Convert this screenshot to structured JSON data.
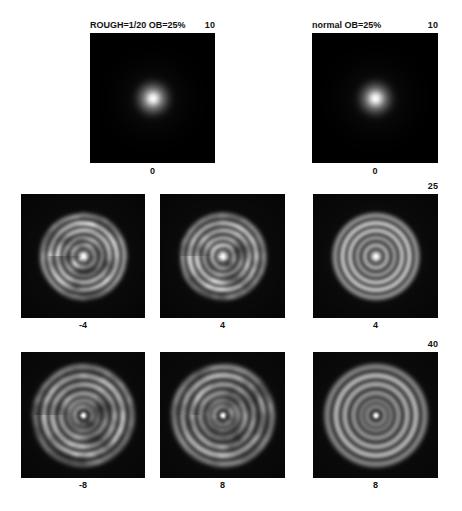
{
  "figure": {
    "kind": "point-spread-function defocus montage",
    "background_color": "#ffffff",
    "panel_background_color": "#000000",
    "text_color": "#111111"
  },
  "titles": {
    "left": "ROUGH=1/20  OB=25%",
    "right": "normal OB=25%"
  },
  "scale_labels": {
    "row1": "10",
    "row2": "25",
    "row3": "40"
  },
  "panels": [
    {
      "id": "r1c1",
      "row": 1,
      "column": 1,
      "caption": "0",
      "scale_max": "10",
      "condition": "ROUGH=1/20  OB=25%",
      "defocus": "0"
    },
    {
      "id": "r1c3",
      "row": 1,
      "column": 3,
      "caption": "0",
      "scale_max": "10",
      "condition": "normal OB=25%",
      "defocus": "0"
    },
    {
      "id": "r2c1",
      "row": 2,
      "column": 1,
      "caption": "-4",
      "scale_max": "25",
      "condition": "ROUGH=1/20  OB=25%",
      "defocus": "-4"
    },
    {
      "id": "r2c2",
      "row": 2,
      "column": 2,
      "caption": "4",
      "scale_max": "25",
      "condition": "ROUGH=1/20  OB=25%",
      "defocus": "4"
    },
    {
      "id": "r2c3",
      "row": 2,
      "column": 3,
      "caption": "4",
      "scale_max": "25",
      "condition": "normal OB=25%",
      "defocus": "4"
    },
    {
      "id": "r3c1",
      "row": 3,
      "column": 1,
      "caption": "-8",
      "scale_max": "40",
      "condition": "ROUGH=1/20  OB=25%",
      "defocus": "-8"
    },
    {
      "id": "r3c2",
      "row": 3,
      "column": 2,
      "caption": "8",
      "scale_max": "40",
      "condition": "ROUGH=1/20  OB=25%",
      "defocus": "8"
    },
    {
      "id": "r3c3",
      "row": 3,
      "column": 3,
      "caption": "8",
      "scale_max": "40",
      "condition": "normal OB=25%",
      "defocus": "8"
    }
  ],
  "chart_data": {
    "type": "heatmap",
    "colormap": "grayscale",
    "legend_position": "none",
    "grid": false,
    "xlabel": "",
    "ylabel": "",
    "rows": [
      {
        "scale_max": 10,
        "defocus_values": [
          0,
          null,
          0
        ],
        "panel_ids": [
          "r1c1",
          null,
          "r1c3"
        ]
      },
      {
        "scale_max": 25,
        "defocus_values": [
          -4,
          4,
          4
        ],
        "panel_ids": [
          "r2c1",
          "r2c2",
          "r2c3"
        ]
      },
      {
        "scale_max": 40,
        "defocus_values": [
          -8,
          8,
          8
        ],
        "panel_ids": [
          "r3c1",
          "r3c2",
          "r3c3"
        ]
      }
    ],
    "columns": [
      {
        "index": 1,
        "condition": "ROUGH=1/20  OB=25%",
        "surface": "rough"
      },
      {
        "index": 2,
        "condition": "ROUGH=1/20  OB=25%",
        "surface": "rough"
      },
      {
        "index": 3,
        "condition": "normal OB=25%",
        "surface": "normal"
      }
    ],
    "panel_intensity": [
      {
        "id": "r1c1",
        "defocus": 0,
        "scale_max": 10,
        "surface": "rough",
        "structure": "compact bright core with faint first ring",
        "core_radius_frac": 0.055,
        "ring_radii_frac": [
          0.1
        ],
        "ring_amplitudes": [
          0.18
        ],
        "envelope_radius_frac": 0.13,
        "speckle_amplitude": 0.05
      },
      {
        "id": "r1c3",
        "defocus": 0,
        "scale_max": 10,
        "surface": "normal",
        "structure": "compact bright core with faint first ring",
        "core_radius_frac": 0.055,
        "ring_radii_frac": [
          0.1
        ],
        "ring_amplitudes": [
          0.16
        ],
        "envelope_radius_frac": 0.13,
        "speckle_amplitude": 0.0
      },
      {
        "id": "r2c1",
        "defocus": -4,
        "scale_max": 25,
        "surface": "rough",
        "structure": "speckled concentric rings, azimuthally broken",
        "core_radius_frac": 0.035,
        "ring_radii_frac": [
          0.09,
          0.15,
          0.21,
          0.27,
          0.33
        ],
        "ring_amplitudes": [
          0.55,
          0.45,
          0.7,
          0.85,
          0.6
        ],
        "envelope_radius_frac": 0.38,
        "speckle_amplitude": 0.55
      },
      {
        "id": "r2c2",
        "defocus": 4,
        "scale_max": 25,
        "surface": "rough",
        "structure": "speckled concentric rings, azimuthally broken",
        "core_radius_frac": 0.035,
        "ring_radii_frac": [
          0.09,
          0.15,
          0.21,
          0.27,
          0.33
        ],
        "ring_amplitudes": [
          0.55,
          0.45,
          0.7,
          0.85,
          0.6
        ],
        "envelope_radius_frac": 0.38,
        "speckle_amplitude": 0.55
      },
      {
        "id": "r2c3",
        "defocus": 4,
        "scale_max": 25,
        "surface": "normal",
        "structure": "smooth concentric rings",
        "core_radius_frac": 0.035,
        "ring_radii_frac": [
          0.09,
          0.15,
          0.21,
          0.27,
          0.33
        ],
        "ring_amplitudes": [
          0.6,
          0.5,
          0.78,
          0.92,
          0.66
        ],
        "envelope_radius_frac": 0.4,
        "speckle_amplitude": 0.0
      },
      {
        "id": "r3c1",
        "defocus": -8,
        "scale_max": 40,
        "surface": "rough",
        "structure": "speckled wide rings with dark obscured centre",
        "core_radius_frac": 0.02,
        "ring_radii_frac": [
          0.07,
          0.12,
          0.18,
          0.25,
          0.32,
          0.39
        ],
        "ring_amplitudes": [
          0.35,
          0.3,
          0.45,
          0.62,
          0.8,
          0.55
        ],
        "envelope_radius_frac": 0.44,
        "speckle_amplitude": 0.55
      },
      {
        "id": "r3c2",
        "defocus": 8,
        "scale_max": 40,
        "surface": "rough",
        "structure": "speckled wide rings with dark obscured centre",
        "core_radius_frac": 0.02,
        "ring_radii_frac": [
          0.07,
          0.12,
          0.18,
          0.25,
          0.32,
          0.39
        ],
        "ring_amplitudes": [
          0.35,
          0.3,
          0.45,
          0.62,
          0.8,
          0.55
        ],
        "envelope_radius_frac": 0.44,
        "speckle_amplitude": 0.55
      },
      {
        "id": "r3c3",
        "defocus": 8,
        "scale_max": 40,
        "surface": "normal",
        "structure": "smooth wide rings with dark obscured centre",
        "core_radius_frac": 0.02,
        "ring_radii_frac": [
          0.07,
          0.12,
          0.18,
          0.25,
          0.32,
          0.39
        ],
        "ring_amplitudes": [
          0.38,
          0.33,
          0.5,
          0.68,
          0.86,
          0.6
        ],
        "envelope_radius_frac": 0.46,
        "speckle_amplitude": 0.0
      }
    ]
  }
}
